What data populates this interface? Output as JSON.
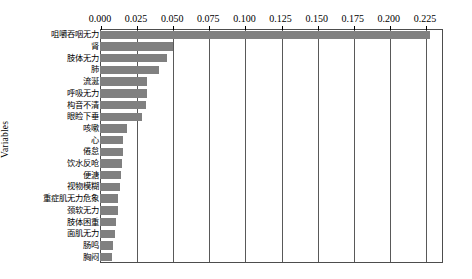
{
  "chart_data": {
    "type": "bar",
    "orientation": "horizontal",
    "title": "",
    "xlabel": "",
    "ylabel": "Variables",
    "xlim": [
      0.0,
      0.2375
    ],
    "xticks": [
      0.0,
      0.025,
      0.05,
      0.075,
      0.1,
      0.125,
      0.15,
      0.175,
      0.2,
      0.225
    ],
    "xtick_labels": [
      "0.000",
      "0.025",
      "0.050",
      "0.075",
      "0.100",
      "0.125",
      "0.150",
      "0.175",
      "0.200",
      "0.225"
    ],
    "grid": true,
    "legend": "none",
    "bar_color": "#808080",
    "categories": [
      "咀嚼吞咽无力",
      "肾",
      "肢体无力",
      "肺",
      "流涎",
      "呼吸无力",
      "构音不清",
      "眼睑下垂",
      "咳嗽",
      "心",
      "倦怠",
      "饮水反呛",
      "便溏",
      "视物模糊",
      "重症肌无力危象",
      "颈软无力",
      "肢体困重",
      "面肌无力",
      "肠鸣",
      "胸闷"
    ],
    "values": [
      0.2285,
      0.0505,
      0.0467,
      0.0409,
      0.0326,
      0.0326,
      0.032,
      0.0294,
      0.0185,
      0.016,
      0.016,
      0.0154,
      0.0147,
      0.0141,
      0.0128,
      0.0122,
      0.0109,
      0.0102,
      0.009,
      0.0083
    ]
  }
}
